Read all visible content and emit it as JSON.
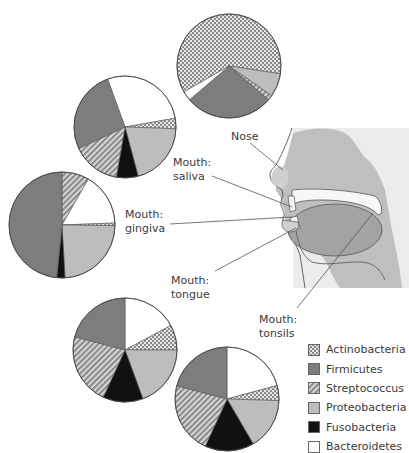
{
  "colors": {
    "Actinobacteria": "#c9c9c9",
    "Firmicutes": "#7d7d7d",
    "Streptococcus": "#b0b0b0",
    "Proteobacteria": "#bdbdbd",
    "Fusobacteria": "#111111",
    "Bacteroidetes": "#ffffff",
    "outline": "#444444",
    "head_bg": "#e8e8e8",
    "head_tissue": "#b9b9b9",
    "tongue": "#9a9a9a"
  },
  "legend": {
    "items": [
      {
        "key": "Actinobacteria",
        "label": "Actinobacteria",
        "pattern": "checker"
      },
      {
        "key": "Firmicutes",
        "label": "Firmicutes",
        "pattern": "solid"
      },
      {
        "key": "Streptococcus",
        "label": "Streptococcus",
        "pattern": "hatch"
      },
      {
        "key": "Proteobacteria",
        "label": "Proteobacteria",
        "pattern": "solid"
      },
      {
        "key": "Fusobacteria",
        "label": "Fusobacteria",
        "pattern": "solid"
      },
      {
        "key": "Bacteroidetes",
        "label": "Bacteroidetes",
        "pattern": "solid"
      }
    ]
  },
  "labels": {
    "nose": "Nose",
    "saliva_line1": "Mouth:",
    "saliva_line2": "saliva",
    "gingiva_line1": "Mouth:",
    "gingiva_line2": "gingiva",
    "tongue_line1": "Mouth:",
    "tongue_line2": "tongue",
    "tonsils_line1": "Mouth:",
    "tonsils_line2": "tonsils"
  },
  "chart_data": [
    {
      "type": "pie",
      "title": "Nose",
      "center": [
        229,
        66
      ],
      "radius": 52,
      "categories": [
        "Actinobacteria",
        "Proteobacteria",
        "Streptococcus",
        "Firmicutes",
        "Bacteroidetes"
      ],
      "start_angle_deg": -120,
      "values": [
        58.3,
        7,
        1.5,
        26.4,
        2.8
      ],
      "note": "values are approximate percentages estimated from slice angles; Actinobacteria slice wraps around top"
    },
    {
      "type": "pie",
      "title": "Mouth: saliva",
      "center": [
        125,
        127
      ],
      "radius": 51,
      "categories": [
        "Bacteroidetes",
        "Actinobacteria",
        "Proteobacteria",
        "Fusobacteria",
        "Streptococcus",
        "Firmicutes"
      ],
      "start_angle_deg": -20,
      "values": [
        27.8,
        3.3,
        20.3,
        6.9,
        15.3,
        26.4
      ]
    },
    {
      "type": "pie",
      "title": "Mouth: gingiva",
      "center": [
        62,
        225
      ],
      "radius": 53,
      "categories": [
        "Streptococcus",
        "Bacteroidetes",
        "Actinobacteria",
        "Proteobacteria",
        "Fusobacteria",
        "Firmicutes"
      ],
      "start_angle_deg": 0,
      "values": [
        8.3,
        16.1,
        0.8,
        23.9,
        2.5,
        48.4
      ]
    },
    {
      "type": "pie",
      "title": "Mouth: tongue",
      "center": [
        125,
        350
      ],
      "radius": 52,
      "categories": [
        "Bacteroidetes",
        "Actinobacteria",
        "Proteobacteria",
        "Fusobacteria",
        "Streptococcus",
        "Firmicutes"
      ],
      "start_angle_deg": 0,
      "values": [
        17.2,
        7.8,
        19.4,
        12.5,
        22.2,
        20.9
      ]
    },
    {
      "type": "pie",
      "title": "Mouth: tonsils",
      "center": [
        227,
        399
      ],
      "radius": 52,
      "categories": [
        "Bacteroidetes",
        "Actinobacteria",
        "Proteobacteria",
        "Fusobacteria",
        "Streptococcus",
        "Firmicutes"
      ],
      "start_angle_deg": 0,
      "values": [
        20.8,
        4.7,
        16.1,
        15.3,
        22.2,
        20.9
      ]
    }
  ]
}
